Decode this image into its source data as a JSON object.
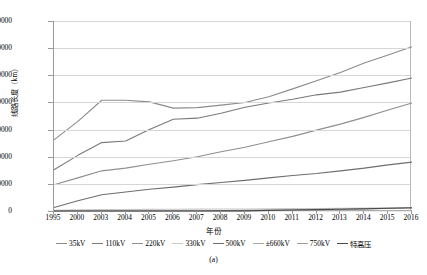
{
  "chart_data": {
    "type": "line",
    "title": "",
    "caption": "(a)",
    "xlabel": "年份",
    "ylabel": "线路长度（km）",
    "grid": true,
    "legend_position": "bottom",
    "ylim": [
      0,
      700000
    ],
    "yticks": [
      0,
      100000,
      200000,
      300000,
      400000,
      500000,
      600000,
      700000
    ],
    "ytick_labels": [
      "0",
      "100000",
      "200000",
      "300000",
      "400000",
      "500000",
      "600000",
      "700000"
    ],
    "categories": [
      "1995",
      "2000",
      "2003",
      "2004",
      "2005",
      "2006",
      "2007",
      "2008",
      "2009",
      "2010",
      "2011",
      "2012",
      "2013",
      "2014",
      "2015",
      "2016"
    ],
    "series": [
      {
        "name": "35kV",
        "color": "#8c8c8c",
        "values": [
          262000,
          330000,
          408000,
          408000,
          402000,
          379000,
          381000,
          390000,
          400000,
          421000,
          450000,
          480000,
          510000,
          545000,
          575000,
          605000
        ]
      },
      {
        "name": "110kV",
        "color": "#7a7a7a",
        "values": [
          152000,
          205000,
          252000,
          258000,
          300000,
          338000,
          342000,
          360000,
          382000,
          398000,
          412000,
          428000,
          438000,
          455000,
          472000,
          490000
        ]
      },
      {
        "name": "220kV",
        "color": "#8f8f8f",
        "values": [
          97000,
          122000,
          148000,
          158000,
          172000,
          185000,
          200000,
          218000,
          235000,
          255000,
          275000,
          298000,
          320000,
          345000,
          372000,
          398000
        ]
      },
      {
        "name": "330kV",
        "color": "#c9c9c9",
        "values": [
          3000,
          4200,
          5200,
          5600,
          6000,
          6400,
          6800,
          7200,
          7600,
          8200,
          8800,
          9400,
          10000,
          10600,
          11200,
          11800
        ]
      },
      {
        "name": "500kV",
        "color": "#6e6e6e",
        "values": [
          13000,
          38000,
          60000,
          70000,
          80000,
          88000,
          97000,
          105000,
          113000,
          122000,
          131000,
          138000,
          148000,
          158000,
          170000,
          180000
        ]
      },
      {
        "name": "±660kV",
        "color": "#aaaaaa",
        "values": [
          0,
          0,
          0,
          0,
          0,
          0,
          0,
          0,
          0,
          1300,
          1300,
          1300,
          1300,
          1300,
          1300,
          1300
        ]
      },
      {
        "name": "750kV",
        "color": "#9e9e9e",
        "values": [
          0,
          0,
          0,
          0,
          140,
          140,
          1200,
          1200,
          2300,
          3600,
          4800,
          6200,
          7400,
          8600,
          9800,
          11000
        ]
      },
      {
        "name": "特高压",
        "color": "#4a4a4a",
        "values": [
          0,
          0,
          0,
          0,
          0,
          0,
          0,
          640,
          640,
          2200,
          3600,
          5000,
          6400,
          8000,
          10000,
          12000
        ]
      }
    ]
  }
}
